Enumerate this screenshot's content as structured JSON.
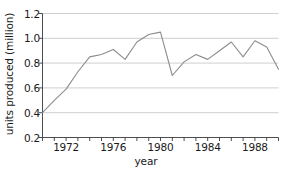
{
  "chart_data": {
    "type": "line",
    "title": "",
    "xlabel": "year",
    "ylabel": "units produced (million)",
    "xlim": [
      1970,
      1990
    ],
    "ylim": [
      0.2,
      1.2
    ],
    "grid": true,
    "grid_axis": "y",
    "legend": "none",
    "line_color": "#8c8c8c",
    "axis_color": "#3a3a3a",
    "grid_color": "#c9c9c9",
    "y_ticks": [
      0.2,
      0.4,
      0.6,
      0.8,
      1.0,
      1.2
    ],
    "y_tick_labels": [
      "0.2",
      "0.4",
      "0.6",
      "0.8",
      "1.0",
      "1.2"
    ],
    "x_ticks": [
      1970,
      1971,
      1972,
      1973,
      1974,
      1975,
      1976,
      1977,
      1978,
      1979,
      1980,
      1981,
      1982,
      1983,
      1984,
      1985,
      1986,
      1987,
      1988,
      1989,
      1990
    ],
    "x_tick_labels_shown": [
      {
        "x": 1972,
        "label": "1972"
      },
      {
        "x": 1976,
        "label": "1976"
      },
      {
        "x": 1980,
        "label": "1980"
      },
      {
        "x": 1984,
        "label": "1984"
      },
      {
        "x": 1988,
        "label": "1988"
      }
    ],
    "x": [
      1970,
      1971,
      1972,
      1973,
      1974,
      1975,
      1976,
      1977,
      1978,
      1979,
      1980,
      1981,
      1982,
      1983,
      1984,
      1985,
      1986,
      1987,
      1988,
      1989,
      1990
    ],
    "values": [
      0.4,
      0.5,
      0.59,
      0.73,
      0.85,
      0.87,
      0.91,
      0.83,
      0.97,
      1.03,
      1.05,
      0.7,
      0.81,
      0.87,
      0.83,
      0.9,
      0.97,
      0.85,
      0.98,
      0.93,
      0.75
    ],
    "series": [
      {
        "name": "units produced",
        "values": [
          0.4,
          0.5,
          0.59,
          0.73,
          0.85,
          0.87,
          0.91,
          0.83,
          0.97,
          1.03,
          1.05,
          0.7,
          0.81,
          0.87,
          0.83,
          0.9,
          0.97,
          0.85,
          0.98,
          0.93,
          0.75
        ]
      }
    ]
  }
}
